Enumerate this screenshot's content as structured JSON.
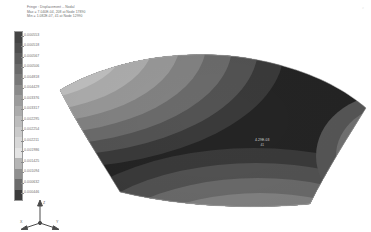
{
  "header": {
    "line1": "Fringe : Displacement -- Nodal",
    "line2": "Max = 7.040E-04, 208 at Node 17890",
    "line3": "Min = 1.082E-07, 41 at Node 12990"
  },
  "legend": {
    "title": "",
    "labels": [
      "0.000553",
      "0.000518",
      "0.000567",
      "0.000506",
      "0.004818",
      "0.004429",
      "0.003376",
      "0.003317",
      "0.002295",
      "0.002254",
      "0.002211",
      "0.001986",
      "0.001425",
      "0.001094",
      "0.000632",
      "0.000446"
    ],
    "swatches": [
      "#444444",
      "#4e4e4e",
      "#5c5c5c",
      "#6a6a6a",
      "#787878",
      "#8a8a8a",
      "#9b9b9b",
      "#ababab",
      "#bcbcbc",
      "#cacaca",
      "#d8d8d8",
      "#e4e4e4",
      "#b5b5b5",
      "#8f8f8f",
      "#6b6b6b",
      "#3c3c3c"
    ]
  },
  "plot": {
    "annotation_value": "4.29E-03",
    "annotation_node": "41",
    "corner_mark": "z"
  },
  "triad": {
    "x_label": "X",
    "y_label": "Y",
    "z_label": "Z"
  },
  "colors": {
    "background": "#ffffff",
    "text": "#6d6d6d",
    "band_dark": "#2a2a2a",
    "band_light": "#ededed"
  },
  "chart_data": {
    "type": "heatmap",
    "title": "Fringe : Displacement -- Nodal",
    "subtitle": "Max = 7.040E-04, 208 at Node 17890 / Min = 1.082E-07, 41 at Node 12990",
    "xlabel": "",
    "ylabel": "",
    "legend_position": "left",
    "grid": false,
    "colorbar_labels": [
      "0.000553",
      "0.000518",
      "0.000567",
      "0.000506",
      "0.004818",
      "0.004429",
      "0.003376",
      "0.003317",
      "0.002295",
      "0.002254",
      "0.002211",
      "0.001986",
      "0.001425",
      "0.001094",
      "0.000632",
      "0.000446"
    ],
    "colorbar_colors": [
      "#444444",
      "#4e4e4e",
      "#5c5c5c",
      "#6a6a6a",
      "#787878",
      "#8a8a8a",
      "#9b9b9b",
      "#ababab",
      "#bcbcbc",
      "#cacaca",
      "#d8d8d8",
      "#e4e4e4",
      "#b5b5b5",
      "#8f8f8f",
      "#6b6b6b",
      "#3c3c3c"
    ],
    "surface": "saddle",
    "contour_bands": 16,
    "annotations": [
      {
        "label": "4.29E-03",
        "node": "41",
        "x": 0.46,
        "y": 0.47
      }
    ]
  }
}
